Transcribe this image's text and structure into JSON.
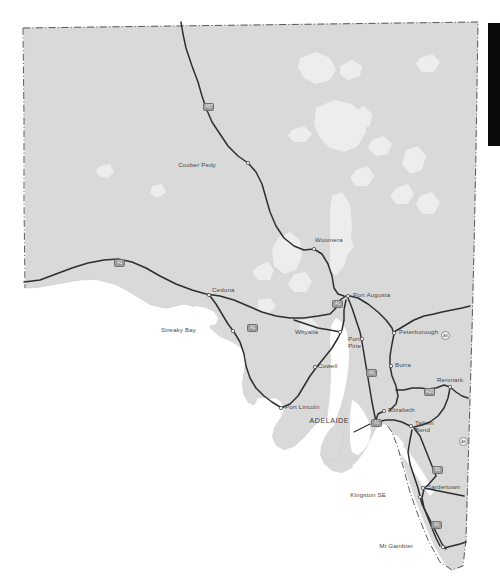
{
  "map": {
    "title": "South Australia road map",
    "region": "South Australia",
    "colors": {
      "land": "#d9d9d9",
      "land_edge": "#cfcfcf",
      "water": "#ffffff",
      "salt_lake": "#eeeeee",
      "road": "#2e2e2e",
      "border": "#4a4a4a",
      "label": "#3a3a3a",
      "shield_fill": "#9a9a9a",
      "sidebar": "#0a0a0a",
      "background": "#ffffff"
    },
    "border_style": "dash-dot",
    "cities": [
      {
        "name": "Coober Pedy",
        "x": 216,
        "y": 165,
        "dot_x": 248,
        "dot_y": 163,
        "type": "town",
        "anchor": "right"
      },
      {
        "name": "Woomera",
        "x": 315,
        "y": 240,
        "dot_x": 314,
        "dot_y": 249,
        "type": "town",
        "anchor": "left"
      },
      {
        "name": "Port Augusta",
        "x": 353,
        "y": 295,
        "dot_x": 348,
        "dot_y": 296,
        "type": "town",
        "anchor": "left"
      },
      {
        "name": "Ceduna",
        "x": 212,
        "y": 290,
        "dot_x": 209,
        "dot_y": 295,
        "type": "town",
        "anchor": "left"
      },
      {
        "name": "Streaky Bay",
        "x": 196,
        "y": 330,
        "dot_x": 233,
        "dot_y": 331,
        "type": "town",
        "anchor": "right"
      },
      {
        "name": "Whyalla",
        "x": 318,
        "y": 332,
        "dot_x": 340,
        "dot_y": 332,
        "type": "town",
        "anchor": "right"
      },
      {
        "name": "Cowell",
        "x": 318,
        "y": 366,
        "dot_x": 315,
        "dot_y": 367,
        "type": "town",
        "anchor": "left"
      },
      {
        "name": "Port Lincoln",
        "x": 285,
        "y": 407,
        "dot_x": 281,
        "dot_y": 408,
        "type": "town",
        "anchor": "left"
      },
      {
        "name": "Peterborough",
        "x": 399,
        "y": 332,
        "dot_x": 394,
        "dot_y": 333,
        "type": "town",
        "anchor": "left"
      },
      {
        "name": "Burra",
        "x": 395,
        "y": 365,
        "dot_x": 391,
        "dot_y": 366,
        "type": "town",
        "anchor": "left"
      },
      {
        "name": "Renmark",
        "x": 437,
        "y": 380,
        "dot_x": 450,
        "dot_y": 387,
        "type": "town",
        "anchor": "left"
      },
      {
        "name": "Elizabeth",
        "x": 388,
        "y": 410,
        "dot_x": 384,
        "dot_y": 411,
        "type": "town",
        "anchor": "left"
      },
      {
        "name": "ADELAIDE",
        "x": 349,
        "y": 421,
        "dot_x": 376,
        "dot_y": 422,
        "type": "capital",
        "anchor": "right"
      },
      {
        "name": "Kingston SE",
        "x": 386,
        "y": 495,
        "dot_x": 420,
        "dot_y": 497,
        "type": "town",
        "anchor": "right"
      },
      {
        "name": "Bardertown",
        "x": 427,
        "y": 487,
        "dot_x": 423,
        "dot_y": 488,
        "type": "town",
        "anchor": "left"
      },
      {
        "name": "Mt Gambier",
        "x": 413,
        "y": 546,
        "dot_x": 443,
        "dot_y": 547,
        "type": "town",
        "anchor": "right"
      }
    ],
    "multiline_cities": [
      {
        "name": "Port Pirie",
        "line1": "Port",
        "line2": "Pirie",
        "x": 348,
        "y": 340,
        "dot_x": 362,
        "dot_y": 339
      },
      {
        "name": "Tailem Bend",
        "line1": "Tailem",
        "line2": "Bend",
        "x": 415,
        "y": 424,
        "dot_x": 411,
        "dot_y": 426
      }
    ],
    "shields": [
      {
        "label": "A87",
        "x": 203,
        "y": 103,
        "style": "box"
      },
      {
        "label": "A1",
        "x": 332,
        "y": 300,
        "style": "box"
      },
      {
        "label": "A1",
        "x": 114,
        "y": 259,
        "style": "box"
      },
      {
        "label": "A1",
        "x": 247,
        "y": 324,
        "style": "box"
      },
      {
        "label": "A1",
        "x": 366,
        "y": 369,
        "style": "box"
      },
      {
        "label": "A1",
        "x": 371,
        "y": 419,
        "style": "box"
      },
      {
        "label": "A20",
        "x": 424,
        "y": 388,
        "style": "box"
      },
      {
        "label": "B1",
        "x": 432,
        "y": 466,
        "style": "box"
      },
      {
        "label": "A1",
        "x": 431,
        "y": 521,
        "style": "box"
      },
      {
        "label": "A8",
        "x": 441,
        "y": 331,
        "style": "open"
      },
      {
        "label": "A8",
        "x": 459,
        "y": 437,
        "style": "open"
      }
    ]
  },
  "sidebar": {
    "name": "right-edge-bar",
    "x": 488,
    "y": 23,
    "width": 12,
    "height": 123
  }
}
